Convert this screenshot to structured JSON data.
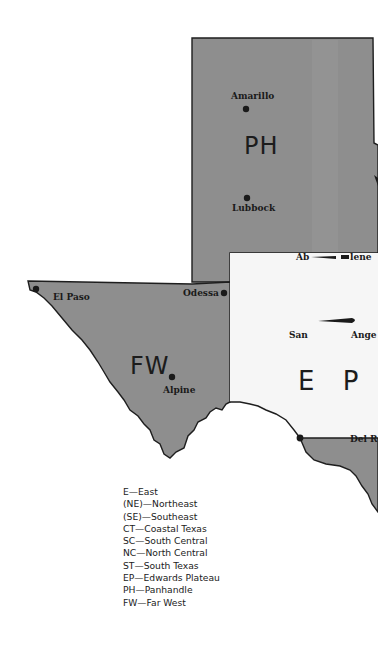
{
  "map": {
    "colors": {
      "region_fill": "#8e8e8e",
      "edwards_plateau_fill": "#f6f6f6",
      "border": "#1e1e1e",
      "background": "#ffffff"
    },
    "regions": [
      {
        "code": "PH",
        "label": "PH"
      },
      {
        "code": "FW",
        "label": "FW"
      },
      {
        "code": "EP",
        "label": "E P"
      }
    ],
    "cities": [
      {
        "name": "Amarillo",
        "label": "Amarillo"
      },
      {
        "name": "Lubbock",
        "label": "Lubbock"
      },
      {
        "name": "Abilene",
        "label_left": "Ab",
        "label_right": "lene"
      },
      {
        "name": "El Paso",
        "label": "El Paso"
      },
      {
        "name": "Odessa",
        "label": "Odessa"
      },
      {
        "name": "Alpine",
        "label": "Alpine"
      },
      {
        "name": "San Angelo",
        "label_left": "San",
        "label_right": "Ange"
      },
      {
        "name": "Del Rio",
        "label": "Del R"
      }
    ]
  },
  "legend": {
    "items": [
      "E—East",
      "(NE)—Northeast",
      "(SE)—Southeast",
      "CT—Coastal Texas",
      "SC—South Central",
      "NC—North Central",
      "ST—South Texas",
      "EP—Edwards Plateau",
      "PH—Panhandle",
      "FW—Far West"
    ]
  }
}
